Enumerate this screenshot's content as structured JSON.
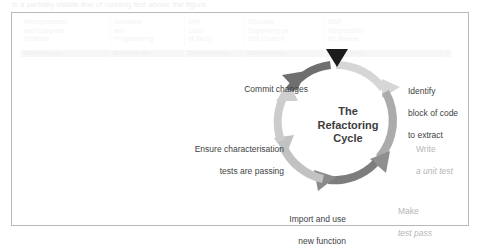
{
  "page": {
    "top_text_fragment": "is a partially visible line of running text above the figure"
  },
  "ghost_table": {
    "headers": [
      "Microprocessor\nand Computer\nSystems",
      "Computer\nand\nProgramming",
      "Unit\nCode\nof Study",
      "Structure\nDepending on\nUnit Content",
      "Staff\nResponsible\nfor Review"
    ],
    "band_cells": [
      "Row value one",
      "Row value two",
      "Row value three",
      "Row value four",
      "Row value five"
    ]
  },
  "diagram": {
    "title_lines": [
      "The",
      "Refactoring",
      "Cycle"
    ],
    "marker": {
      "name": "start-marker-triangle",
      "color": "#1a1a1a"
    },
    "colors": {
      "arrow_dark": "#6b6b6b",
      "arrow_light": "#cfcfcf",
      "arrow_mid": "#9a9a9a",
      "text_dark": "#3f3f3f",
      "text_muted": "#b6b6b6"
    },
    "steps": [
      {
        "id": "identify",
        "name": "identify-block-label",
        "lines": [
          "Identify",
          "block of code",
          "to extract"
        ],
        "muted": false,
        "italic_lines": []
      },
      {
        "id": "write-test",
        "name": "write-unit-test-label",
        "lines": [
          "Write",
          "a unit test"
        ],
        "muted": true,
        "italic_lines": [
          "a unit test"
        ]
      },
      {
        "id": "make-test-pass",
        "name": "make-test-pass-label",
        "lines": [
          "Make",
          "test pass"
        ],
        "muted": true,
        "italic_lines": [
          "test pass"
        ]
      },
      {
        "id": "import-use",
        "name": "import-new-function-label",
        "lines": [
          "Import and use",
          "new function"
        ],
        "muted": false,
        "italic_lines": []
      },
      {
        "id": "ensure-tests",
        "name": "ensure-characterisation-label",
        "lines": [
          "Ensure characterisation",
          "tests are passing"
        ],
        "muted": false,
        "italic_lines": []
      },
      {
        "id": "commit",
        "name": "commit-changes-label",
        "lines": [
          "Commit changes"
        ],
        "muted": false,
        "italic_lines": []
      }
    ]
  }
}
